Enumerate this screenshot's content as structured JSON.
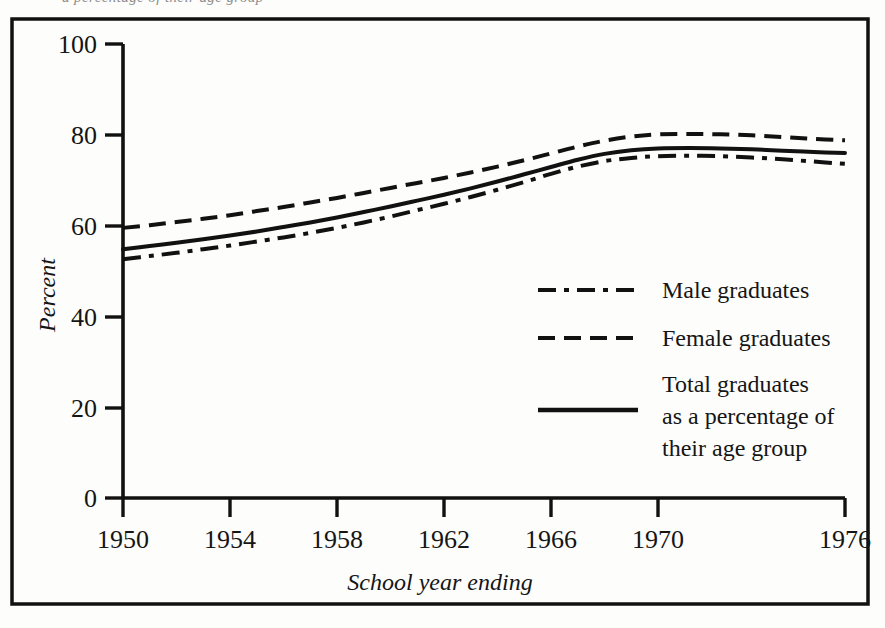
{
  "figure": {
    "frame_color": "#111111",
    "background": "#fdfdfc",
    "partial_caption_above": "a percentage of their age group"
  },
  "chart_data": {
    "type": "line",
    "title": "",
    "xlabel": "School year ending",
    "ylabel": "Percent",
    "xlim": [
      1950,
      1976
    ],
    "ylim": [
      0,
      100
    ],
    "grid": false,
    "legend_position": "inside-right",
    "xticks": [
      "1950",
      "1954",
      "1958",
      "1962",
      "1966",
      "1970",
      "1976"
    ],
    "xtick_values": [
      1950,
      1954,
      1958,
      1962,
      1966,
      1970,
      1976
    ],
    "yticks": [
      "0",
      "20",
      "40",
      "60",
      "80",
      "100"
    ],
    "ytick_values": [
      0,
      20,
      40,
      60,
      80,
      100
    ],
    "x": [
      1950,
      1951,
      1952,
      1953,
      1954,
      1955,
      1956,
      1957,
      1958,
      1959,
      1960,
      1961,
      1962,
      1963,
      1964,
      1965,
      1966,
      1967,
      1968,
      1969,
      1970,
      1971,
      1972,
      1973,
      1974,
      1975,
      1976
    ],
    "series": [
      {
        "name": "Male graduates",
        "style": "dash-dot",
        "color": "#111111",
        "values": [
          52.6,
          53.3,
          54.0,
          54.8,
          55.6,
          56.5,
          57.4,
          58.4,
          59.5,
          60.7,
          62.0,
          63.4,
          64.8,
          66.3,
          67.9,
          69.6,
          71.4,
          73.0,
          74.2,
          74.9,
          75.3,
          75.4,
          75.3,
          75.0,
          74.6,
          74.1,
          73.6
        ]
      },
      {
        "name": "Female graduates",
        "style": "dashed",
        "color": "#111111",
        "values": [
          59.5,
          60.1,
          60.8,
          61.5,
          62.3,
          63.2,
          64.1,
          65.1,
          66.1,
          67.2,
          68.3,
          69.4,
          70.5,
          71.7,
          73.0,
          74.4,
          75.9,
          77.4,
          78.7,
          79.6,
          80.1,
          80.2,
          80.1,
          79.9,
          79.5,
          79.1,
          78.8
        ]
      },
      {
        "name": "Total graduates as a percentage of their age group",
        "style": "solid",
        "color": "#111111",
        "values": [
          54.8,
          55.5,
          56.2,
          57.0,
          57.8,
          58.7,
          59.7,
          60.7,
          61.8,
          63.0,
          64.2,
          65.5,
          66.8,
          68.2,
          69.7,
          71.3,
          72.9,
          74.5,
          75.8,
          76.6,
          77.0,
          77.1,
          77.0,
          76.8,
          76.5,
          76.2,
          76.0
        ]
      }
    ],
    "legend": [
      {
        "label": "Male graduates",
        "style": "dash-dot"
      },
      {
        "label": "Female graduates",
        "style": "dashed"
      },
      {
        "label_line1": "Total graduates",
        "label_line2": "as a percentage of",
        "label_line3": "their age group",
        "style": "solid"
      }
    ]
  }
}
